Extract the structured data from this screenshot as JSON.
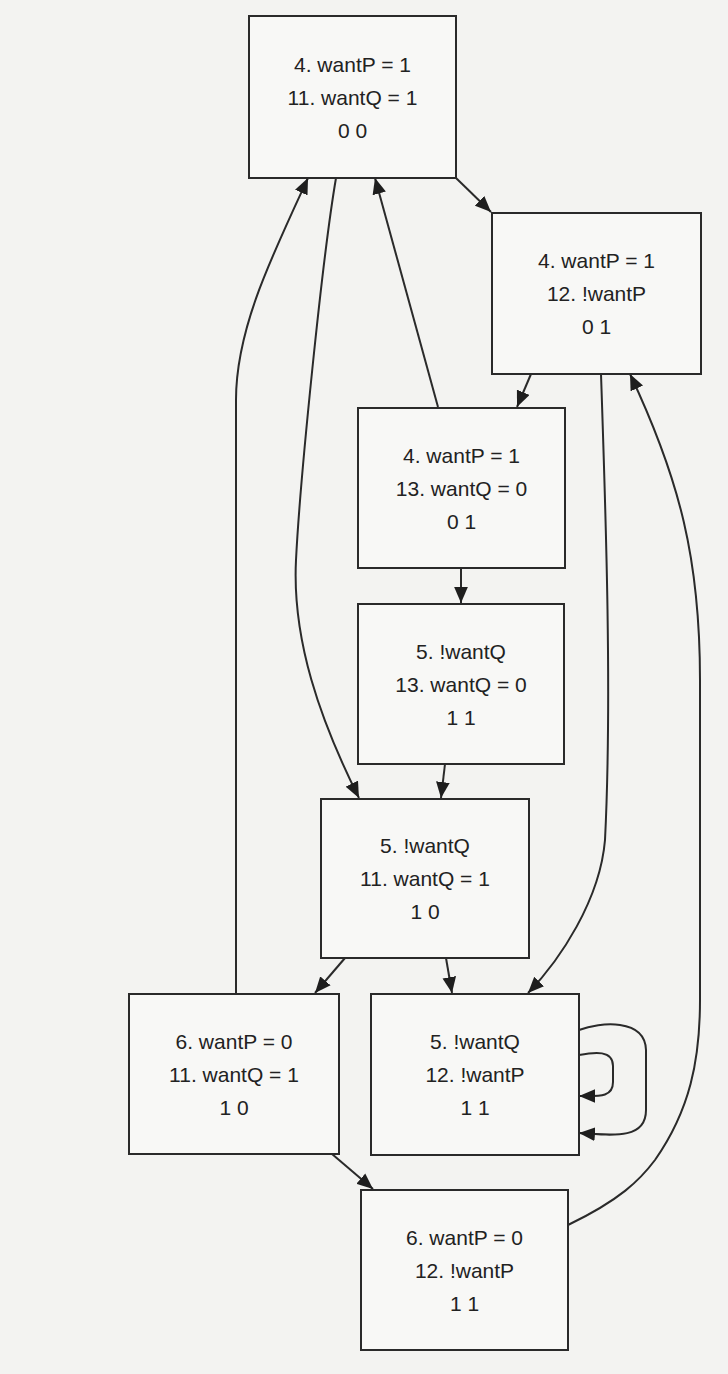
{
  "diagram": {
    "type": "state-transition-graph",
    "nodes": [
      {
        "id": "n1",
        "line1": "4. wantP = 1",
        "line2": "11. wantQ = 1",
        "line3": "0 0",
        "x": 248,
        "y": 15,
        "w": 209,
        "h": 164
      },
      {
        "id": "n2",
        "line1": "4. wantP = 1",
        "line2": "12. !wantP",
        "line3": "0 1",
        "x": 491,
        "y": 212,
        "w": 211,
        "h": 163
      },
      {
        "id": "n3",
        "line1": "4. wantP = 1",
        "line2": "13. wantQ = 0",
        "line3": "0 1",
        "x": 357,
        "y": 407,
        "w": 209,
        "h": 162
      },
      {
        "id": "n4",
        "line1": "5. !wantQ",
        "line2": "13. wantQ = 0",
        "line3": "1 1",
        "x": 357,
        "y": 603,
        "w": 208,
        "h": 162
      },
      {
        "id": "n5",
        "line1": "5. !wantQ",
        "line2": "11. wantQ = 1",
        "line3": "1 0",
        "x": 320,
        "y": 798,
        "w": 210,
        "h": 161
      },
      {
        "id": "n6",
        "line1": "6. wantP = 0",
        "line2": "11. wantQ = 1",
        "line3": "1 0",
        "x": 128,
        "y": 993,
        "w": 212,
        "h": 162
      },
      {
        "id": "n7",
        "line1": "5. !wantQ",
        "line2": "12. !wantP",
        "line3": "1 1",
        "x": 370,
        "y": 993,
        "w": 210,
        "h": 163
      },
      {
        "id": "n8",
        "line1": "6. wantP = 0",
        "line2": "12. !wantP",
        "line3": "1 1",
        "x": 360,
        "y": 1189,
        "w": 209,
        "h": 162
      }
    ],
    "edges": [
      {
        "from": "n1",
        "to": "n2"
      },
      {
        "from": "n2",
        "to": "n3"
      },
      {
        "from": "n3",
        "to": "n1"
      },
      {
        "from": "n3",
        "to": "n4"
      },
      {
        "from": "n4",
        "to": "n5"
      },
      {
        "from": "n1",
        "to": "n5"
      },
      {
        "from": "n6",
        "to": "n1"
      },
      {
        "from": "n5",
        "to": "n6"
      },
      {
        "from": "n5",
        "to": "n7"
      },
      {
        "from": "n2",
        "to": "n7"
      },
      {
        "from": "n7",
        "to": "n7"
      },
      {
        "from": "n7",
        "to": "n7"
      },
      {
        "from": "n6",
        "to": "n8"
      },
      {
        "from": "n8",
        "to": "n2"
      }
    ],
    "colors": {
      "line": "#2a2a2a",
      "background": "#f3f3f1",
      "text": "#222222"
    }
  }
}
